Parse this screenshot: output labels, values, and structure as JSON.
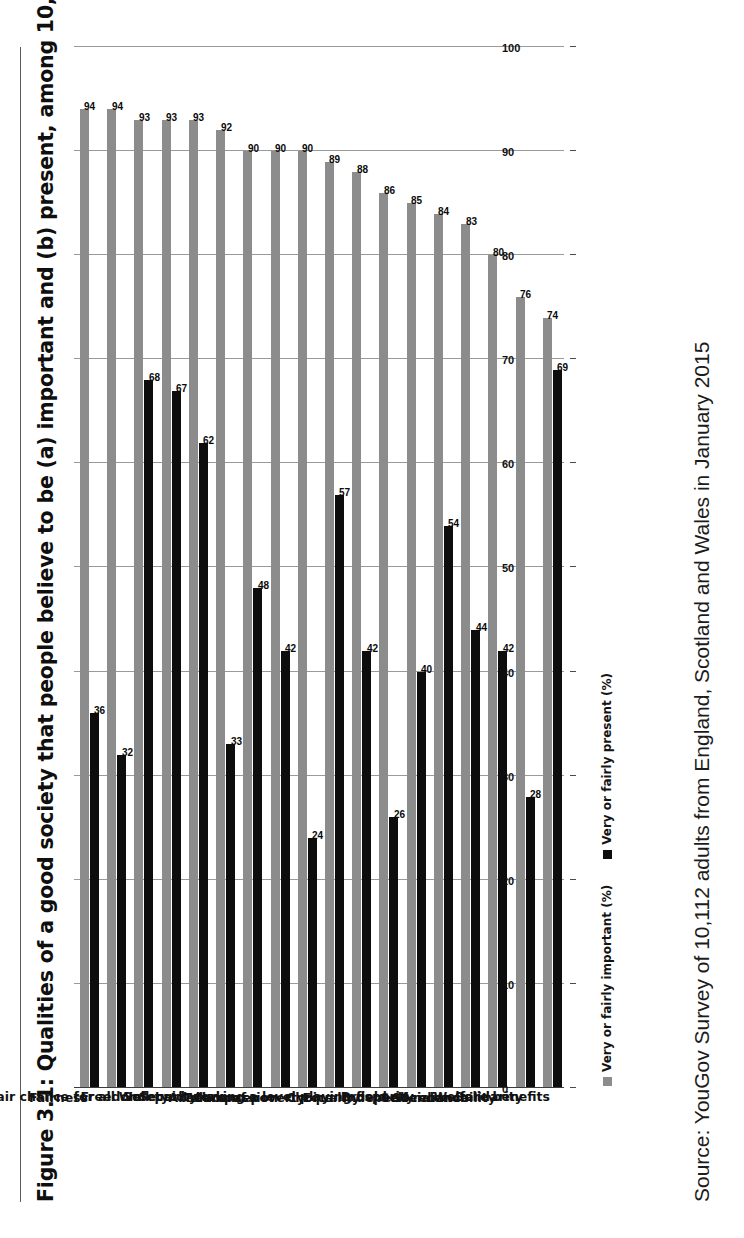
{
  "figure": {
    "title": "Figure 3.1: Qualities of a good society that people believe to be (a) important and (b) present, among 10,112 respondents",
    "source": "Source: YouGov Survey of 10,112 adults from England, Scotland and Wales in January 2015"
  },
  "legend": {
    "items": [
      {
        "label": "Very or fairly important (%)",
        "color": "#8c8c8c",
        "key": "important"
      },
      {
        "label": "Very or fairly present (%)",
        "color": "#0d0d0d",
        "key": "present"
      }
    ]
  },
  "chart_data": {
    "type": "bar",
    "title": "Figure 3.1: Qualities of a good society that people believe to be (a) important and (b) present, among 10,112 respondents",
    "xlabel": "",
    "ylabel": "",
    "orientation": "vertical",
    "grid": true,
    "legend_position": "bottom-left",
    "ylim": [
      0,
      100
    ],
    "yticks": [
      0,
      10,
      20,
      30,
      40,
      50,
      60,
      70,
      80,
      90,
      100
    ],
    "tick_labels": [
      "0",
      "10",
      "20",
      "30",
      "40",
      "50",
      "60",
      "70",
      "80",
      "90",
      "100"
    ],
    "categories": [
      "Fairness",
      "A fair chance for all",
      "Freedom",
      "Safety",
      "Security",
      "Well-paid work",
      "Tolerance",
      "Compassion",
      "Absence of poverty",
      "Choice",
      "Equality",
      "Having a level playing field",
      "Prosperity",
      "Independence",
      "Self-reliance",
      "Social mobility",
      "Solidarity",
      "Welfare benefits"
    ],
    "series": [
      {
        "name": "Very or fairly important (%)",
        "color": "#8c8c8c",
        "values": [
          94,
          94,
          93,
          93,
          93,
          92,
          90,
          90,
          90,
          89,
          88,
          86,
          85,
          84,
          83,
          80,
          76,
          74
        ]
      },
      {
        "name": "Very or fairly present (%)",
        "color": "#0d0d0d",
        "values": [
          36,
          32,
          68,
          67,
          62,
          33,
          48,
          42,
          24,
          57,
          42,
          26,
          40,
          54,
          44,
          42,
          28,
          69
        ]
      }
    ]
  }
}
